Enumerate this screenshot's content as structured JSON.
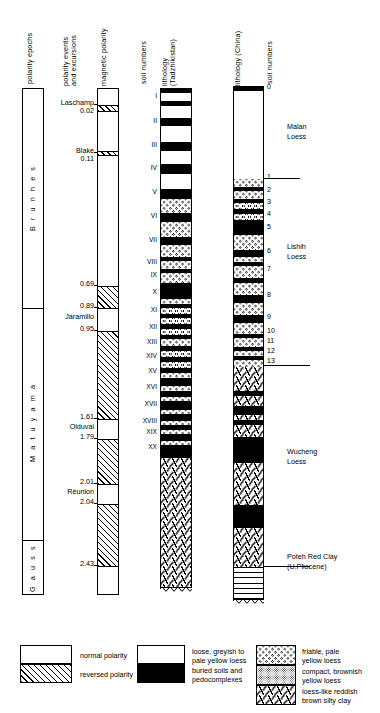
{
  "column_headers": {
    "polarity_epochs": "polarity epochs",
    "polarity_events": "polarity events\nand excursions",
    "magnetic_polarity": "magnetic polarity",
    "soil_numbers_left": "soil numbers",
    "lithology_tadzhikistan": "lithology\n(Tadzhikistan)",
    "lithology_china": "lithology (China)",
    "soil_numbers_right": "soil numbers"
  },
  "epochs": [
    {
      "name": "B r u n h e s",
      "top": 88,
      "bottom": 308
    },
    {
      "name": "M a t u y a m a",
      "top": 308,
      "bottom": 540
    },
    {
      "name": "G a u s s",
      "top": 540,
      "bottom": 595
    }
  ],
  "polarity_events": [
    {
      "name": "Laschamp",
      "age": "0.02",
      "y": 104
    },
    {
      "name": "Blake",
      "age": "0.11",
      "y": 152
    },
    {
      "name": "",
      "age": "0.69",
      "y": 285
    },
    {
      "name": "",
      "age": "0.89",
      "y": 307
    },
    {
      "name": "Jaramillo",
      "age": "",
      "y": 318
    },
    {
      "name": "",
      "age": "0.95",
      "y": 330
    },
    {
      "name": "",
      "age": "1.61",
      "y": 418
    },
    {
      "name": "Olduvai",
      "age": "",
      "y": 428
    },
    {
      "name": "",
      "age": "1.79",
      "y": 438
    },
    {
      "name": "",
      "age": "2.01",
      "y": 483
    },
    {
      "name": "Réunion",
      "age": "",
      "y": 493
    },
    {
      "name": "",
      "age": "2.04",
      "y": 503
    },
    {
      "name": "",
      "age": "2.43",
      "y": 565
    }
  ],
  "magnetic_polarity_segments": [
    {
      "polarity": "normal",
      "top": 88,
      "bottom": 104
    },
    {
      "polarity": "reversed",
      "top": 104,
      "bottom": 110
    },
    {
      "polarity": "normal",
      "top": 110,
      "bottom": 150
    },
    {
      "polarity": "reversed",
      "top": 150,
      "bottom": 154
    },
    {
      "polarity": "normal",
      "top": 154,
      "bottom": 285
    },
    {
      "polarity": "reversed",
      "top": 285,
      "bottom": 307
    },
    {
      "polarity": "normal",
      "top": 307,
      "bottom": 330
    },
    {
      "polarity": "reversed",
      "top": 330,
      "bottom": 418
    },
    {
      "polarity": "normal",
      "top": 418,
      "bottom": 438
    },
    {
      "polarity": "reversed",
      "top": 438,
      "bottom": 483
    },
    {
      "polarity": "normal",
      "top": 483,
      "bottom": 503
    },
    {
      "polarity": "reversed",
      "top": 503,
      "bottom": 565
    },
    {
      "polarity": "normal",
      "top": 565,
      "bottom": 595
    }
  ],
  "tadzhikistan_soils": [
    {
      "label": "I",
      "y": 96
    },
    {
      "label": "II",
      "y": 121
    },
    {
      "label": "III",
      "y": 145
    },
    {
      "label": "IV",
      "y": 168
    },
    {
      "label": "V",
      "y": 192
    },
    {
      "label": "VI",
      "y": 216
    },
    {
      "label": "VII",
      "y": 240
    },
    {
      "label": "VIII",
      "y": 262
    },
    {
      "label": "IX",
      "y": 275
    },
    {
      "label": "X",
      "y": 292
    },
    {
      "label": "XI",
      "y": 310
    },
    {
      "label": "XII",
      "y": 327
    },
    {
      "label": "XIII",
      "y": 342
    },
    {
      "label": "XIV",
      "y": 356
    },
    {
      "label": "XV",
      "y": 371
    },
    {
      "label": "XVI",
      "y": 387
    },
    {
      "label": "XVII",
      "y": 404
    },
    {
      "label": "XVIII",
      "y": 421
    },
    {
      "label": "XIX",
      "y": 432
    },
    {
      "label": "XX",
      "y": 447
    }
  ],
  "tadzhikistan_beds": [
    {
      "fill": "black",
      "top": 88,
      "bottom": 92
    },
    {
      "fill": "stipple",
      "top": 92,
      "bottom": 100
    },
    {
      "fill": "black",
      "top": 100,
      "bottom": 105
    },
    {
      "fill": "stipple",
      "top": 105,
      "bottom": 117
    },
    {
      "fill": "black",
      "top": 117,
      "bottom": 125
    },
    {
      "fill": "stipple",
      "top": 125,
      "bottom": 141
    },
    {
      "fill": "black",
      "top": 141,
      "bottom": 150
    },
    {
      "fill": "stipple",
      "top": 150,
      "bottom": 163
    },
    {
      "fill": "black",
      "top": 163,
      "bottom": 173
    },
    {
      "fill": "stipple",
      "top": 173,
      "bottom": 188
    },
    {
      "fill": "black",
      "top": 188,
      "bottom": 198
    },
    {
      "fill": "ring",
      "top": 198,
      "bottom": 212
    },
    {
      "fill": "black",
      "top": 212,
      "bottom": 221
    },
    {
      "fill": "ring",
      "top": 221,
      "bottom": 236
    },
    {
      "fill": "black",
      "top": 236,
      "bottom": 244
    },
    {
      "fill": "ring",
      "top": 244,
      "bottom": 256
    },
    {
      "fill": "black",
      "top": 256,
      "bottom": 260
    },
    {
      "fill": "ring",
      "top": 260,
      "bottom": 268
    },
    {
      "fill": "black",
      "top": 268,
      "bottom": 272
    },
    {
      "fill": "ring",
      "top": 272,
      "bottom": 282
    },
    {
      "fill": "black",
      "top": 282,
      "bottom": 298
    },
    {
      "fill": "ring",
      "top": 298,
      "bottom": 303
    },
    {
      "fill": "black",
      "top": 303,
      "bottom": 307
    },
    {
      "fill": "ring",
      "top": 307,
      "bottom": 313
    },
    {
      "fill": "black",
      "top": 313,
      "bottom": 317
    },
    {
      "fill": "ring",
      "top": 317,
      "bottom": 323
    },
    {
      "fill": "black",
      "top": 323,
      "bottom": 328
    },
    {
      "fill": "ring",
      "top": 328,
      "bottom": 334
    },
    {
      "fill": "black",
      "top": 334,
      "bottom": 338
    },
    {
      "fill": "ring",
      "top": 338,
      "bottom": 345
    },
    {
      "fill": "black",
      "top": 345,
      "bottom": 350
    },
    {
      "fill": "ring",
      "top": 350,
      "bottom": 356
    },
    {
      "fill": "black",
      "top": 356,
      "bottom": 361
    },
    {
      "fill": "ring",
      "top": 361,
      "bottom": 367
    },
    {
      "fill": "black",
      "top": 367,
      "bottom": 372
    },
    {
      "fill": "ring",
      "top": 372,
      "bottom": 377
    },
    {
      "fill": "black",
      "top": 377,
      "bottom": 385
    },
    {
      "fill": "ring",
      "top": 385,
      "bottom": 390
    },
    {
      "fill": "black",
      "top": 390,
      "bottom": 396
    },
    {
      "fill": "ring",
      "top": 396,
      "bottom": 400
    },
    {
      "fill": "black",
      "top": 400,
      "bottom": 409
    },
    {
      "fill": "ring",
      "top": 409,
      "bottom": 413
    },
    {
      "fill": "black",
      "top": 413,
      "bottom": 420
    },
    {
      "fill": "ring",
      "top": 420,
      "bottom": 424
    },
    {
      "fill": "black",
      "top": 424,
      "bottom": 429
    },
    {
      "fill": "ring",
      "top": 429,
      "bottom": 433
    },
    {
      "fill": "black",
      "top": 433,
      "bottom": 440
    },
    {
      "fill": "ring",
      "top": 440,
      "bottom": 444
    },
    {
      "fill": "black",
      "top": 444,
      "bottom": 457
    },
    {
      "fill": "clay",
      "top": 457,
      "bottom": 588
    }
  ],
  "china_soils": [
    {
      "label": "0",
      "y": 88
    },
    {
      "label": "1",
      "y": 178
    },
    {
      "label": "2",
      "y": 191
    },
    {
      "label": "3",
      "y": 203
    },
    {
      "label": "4",
      "y": 215
    },
    {
      "label": "5",
      "y": 228
    },
    {
      "label": "6",
      "y": 252
    },
    {
      "label": "7",
      "y": 270
    },
    {
      "label": "8",
      "y": 296
    },
    {
      "label": "9",
      "y": 318
    },
    {
      "label": "10",
      "y": 332
    },
    {
      "label": "11",
      "y": 342
    },
    {
      "label": "12",
      "y": 352
    },
    {
      "label": "13",
      "y": 362
    }
  ],
  "china_units": [
    {
      "name": "Malan\nLoess",
      "y": 130
    },
    {
      "name": "Lishih\nLoess",
      "y": 250
    },
    {
      "name": "Wucheng\nLoess",
      "y": 455
    },
    {
      "name": "Poteh Red Clay\n(U.Pliocene)",
      "y": 560
    }
  ],
  "china_beds": [
    {
      "fill": "black",
      "top": 86,
      "bottom": 90
    },
    {
      "fill": "stipple",
      "top": 90,
      "bottom": 178
    },
    {
      "fill": "ring",
      "top": 178,
      "bottom": 186
    },
    {
      "fill": "black",
      "top": 186,
      "bottom": 190
    },
    {
      "fill": "ring",
      "top": 190,
      "bottom": 198
    },
    {
      "fill": "black",
      "top": 198,
      "bottom": 202
    },
    {
      "fill": "ring",
      "top": 202,
      "bottom": 208
    },
    {
      "fill": "black",
      "top": 208,
      "bottom": 213
    },
    {
      "fill": "ring",
      "top": 213,
      "bottom": 219
    },
    {
      "fill": "black",
      "top": 219,
      "bottom": 234
    },
    {
      "fill": "ring",
      "top": 234,
      "bottom": 249
    },
    {
      "fill": "black",
      "top": 249,
      "bottom": 256
    },
    {
      "fill": "ring",
      "top": 256,
      "bottom": 261
    },
    {
      "fill": "black",
      "top": 261,
      "bottom": 265
    },
    {
      "fill": "ring",
      "top": 265,
      "bottom": 277
    },
    {
      "fill": "black",
      "top": 277,
      "bottom": 282
    },
    {
      "fill": "ring",
      "top": 282,
      "bottom": 294
    },
    {
      "fill": "black",
      "top": 294,
      "bottom": 302
    },
    {
      "fill": "ring",
      "top": 302,
      "bottom": 314
    },
    {
      "fill": "black",
      "top": 314,
      "bottom": 322
    },
    {
      "fill": "ring",
      "top": 322,
      "bottom": 333
    },
    {
      "fill": "black",
      "top": 333,
      "bottom": 337
    },
    {
      "fill": "ring",
      "top": 337,
      "bottom": 346
    },
    {
      "fill": "black",
      "top": 346,
      "bottom": 350
    },
    {
      "fill": "ring",
      "top": 350,
      "bottom": 355
    },
    {
      "fill": "black",
      "top": 355,
      "bottom": 359
    },
    {
      "fill": "ring",
      "top": 359,
      "bottom": 366
    },
    {
      "fill": "clay",
      "top": 366,
      "bottom": 390
    },
    {
      "fill": "black",
      "top": 390,
      "bottom": 395
    },
    {
      "fill": "clay",
      "top": 395,
      "bottom": 405
    },
    {
      "fill": "black",
      "top": 405,
      "bottom": 414
    },
    {
      "fill": "clay",
      "top": 414,
      "bottom": 419
    },
    {
      "fill": "black",
      "top": 419,
      "bottom": 424
    },
    {
      "fill": "clay",
      "top": 424,
      "bottom": 436
    },
    {
      "fill": "black",
      "top": 436,
      "bottom": 462
    },
    {
      "fill": "clay",
      "top": 462,
      "bottom": 504
    },
    {
      "fill": "black",
      "top": 504,
      "bottom": 527
    },
    {
      "fill": "clay",
      "top": 527,
      "bottom": 566
    },
    {
      "fill": "horizontal",
      "top": 566,
      "bottom": 600
    }
  ],
  "legend": {
    "polarity": [
      {
        "swatch": "white",
        "label": "normal polarity"
      },
      {
        "swatch": "hatch",
        "label": "reversed polarity"
      }
    ],
    "tadzhikistan": [
      {
        "swatch": "stipple",
        "label": "loose, greyish to\npale yellow loess"
      },
      {
        "swatch": "black",
        "label": "buried soils and\npedocomplexes"
      }
    ],
    "china": [
      {
        "swatch": "ring",
        "label": "friable, pale\nyellow loess"
      },
      {
        "swatch": "stipple2",
        "label": "compact, brownish\nyellow loess"
      },
      {
        "swatch": "clay",
        "label": "loess-like reddish\nbrown silty clay"
      }
    ]
  },
  "colors": {
    "ink": "#000000",
    "paper": "#ffffff"
  }
}
